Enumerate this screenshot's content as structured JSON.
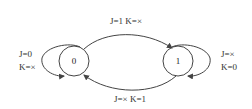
{
  "diagram": {
    "type": "state-transition",
    "states": [
      {
        "id": "s0",
        "label": "0"
      },
      {
        "id": "s1",
        "label": "1"
      }
    ],
    "transitions": {
      "self_0": {
        "j": "J=0",
        "k": "K=×"
      },
      "s0_to_s1": {
        "label": "J=1  K=×"
      },
      "self_1": {
        "j": "J=×",
        "k": "K=0"
      },
      "s1_to_s0": {
        "label": "J=×  K=1"
      }
    },
    "colors": {
      "stroke": "#444444",
      "text": "#333333",
      "background": "#ffffff"
    }
  }
}
